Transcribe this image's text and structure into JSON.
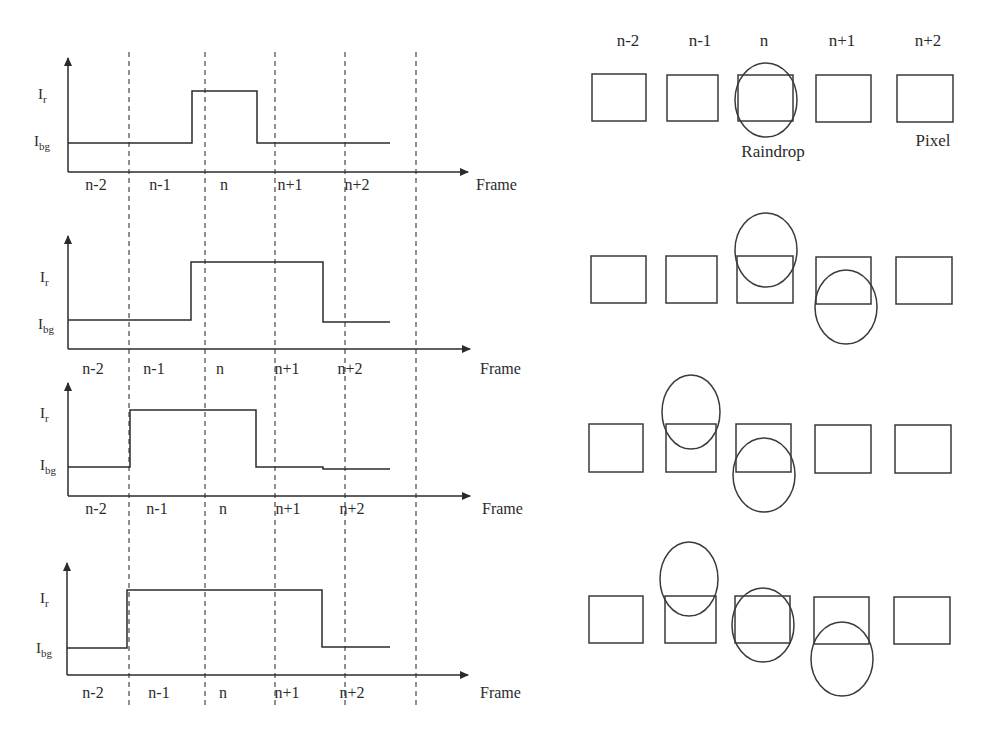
{
  "header": {
    "clipped_title": ""
  },
  "left_panel": {
    "y_labels": {
      "high": "I",
      "high_sub": "r",
      "low": "I",
      "low_sub": "bg"
    },
    "x_axis_label": "Frame",
    "frames": [
      "n-2",
      "n-1",
      "n",
      "n+1",
      "n+2"
    ],
    "panels": [
      {
        "id": 1,
        "high_frames": [
          "n"
        ]
      },
      {
        "id": 2,
        "high_frames": [
          "n",
          "n+1"
        ]
      },
      {
        "id": 3,
        "high_frames": [
          "n-1",
          "n"
        ]
      },
      {
        "id": 4,
        "high_frames": [
          "n-1",
          "n",
          "n+1"
        ]
      }
    ]
  },
  "right_panel": {
    "column_labels": [
      "n-2",
      "n-1",
      "n",
      "n+1",
      "n+2"
    ],
    "raindrop_label": "Raindrop",
    "pixel_label": "Pixel",
    "rows": [
      {
        "id": 1,
        "raindrops": [
          {
            "pixel": "n",
            "position": "centered"
          }
        ]
      },
      {
        "id": 2,
        "raindrops": [
          {
            "pixel": "n",
            "position": "upper"
          },
          {
            "pixel": "n+1",
            "position": "lower"
          }
        ]
      },
      {
        "id": 3,
        "raindrops": [
          {
            "pixel": "n-1",
            "position": "upper"
          },
          {
            "pixel": "n",
            "position": "lower"
          }
        ]
      },
      {
        "id": 4,
        "raindrops": [
          {
            "pixel": "n-1",
            "position": "upper"
          },
          {
            "pixel": "n",
            "position": "centered"
          },
          {
            "pixel": "n+1",
            "position": "lower"
          }
        ]
      }
    ]
  },
  "colors": {
    "line": "#2b2b2b",
    "dashed": "#555555",
    "background": "#ffffff"
  }
}
